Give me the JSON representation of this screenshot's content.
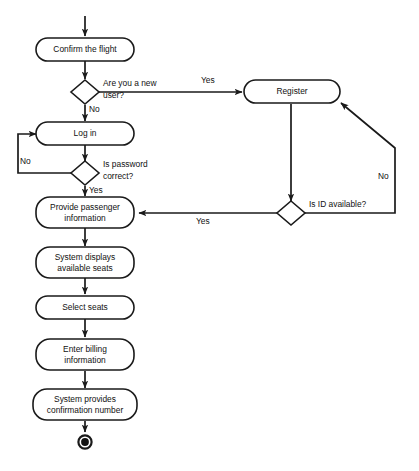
{
  "diagram": {
    "type": "activity-diagram",
    "stroke_color": "#1a1a1a",
    "fill_color": "#ffffff",
    "text_color": "#111111",
    "nodes": [
      {
        "id": "confirm_flight",
        "kind": "action",
        "label": "Confirm the flight",
        "lines": [
          "Confirm the flight"
        ]
      },
      {
        "id": "new_user",
        "kind": "decision",
        "label": "Are you a new user?",
        "lines": [
          "Are you a new",
          "user?"
        ]
      },
      {
        "id": "register",
        "kind": "action",
        "label": "Register",
        "lines": [
          "Register"
        ]
      },
      {
        "id": "log_in",
        "kind": "action",
        "label": "Log in",
        "lines": [
          "Log in"
        ]
      },
      {
        "id": "password_correct",
        "kind": "decision",
        "label": "Is password correct?",
        "lines": [
          "Is password",
          "correct?"
        ]
      },
      {
        "id": "id_available",
        "kind": "decision",
        "label": "Is ID available?",
        "lines": [
          "Is ID available?"
        ]
      },
      {
        "id": "provide_passenger",
        "kind": "action",
        "label": "Provide passenger information",
        "lines": [
          "Provide passenger",
          "information"
        ]
      },
      {
        "id": "display_seats",
        "kind": "action",
        "label": "System displays available seats",
        "lines": [
          "System displays",
          "available seats"
        ]
      },
      {
        "id": "select_seats",
        "kind": "action",
        "label": "Select seats",
        "lines": [
          "Select seats"
        ]
      },
      {
        "id": "enter_billing",
        "kind": "action",
        "label": "Enter billing information",
        "lines": [
          "Enter billing",
          "information"
        ]
      },
      {
        "id": "confirmation_number",
        "kind": "action",
        "label": "System provides confirmation number",
        "lines": [
          "System provides",
          "confirmation number"
        ]
      },
      {
        "id": "final_node",
        "kind": "final",
        "label": "Final node",
        "lines": []
      }
    ],
    "edge_labels": {
      "new_user_yes": "Yes",
      "new_user_no": "No",
      "password_no": "No",
      "password_yes": "Yes",
      "id_available_yes": "Yes",
      "id_available_no": "No"
    }
  }
}
